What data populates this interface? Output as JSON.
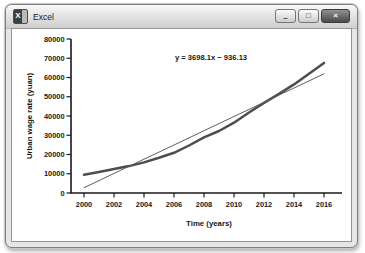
{
  "window": {
    "title": "Excel",
    "icon": "excel-logo-icon",
    "icon_letter": "X",
    "controls": [
      {
        "name": "minimize",
        "glyph": "–"
      },
      {
        "name": "maximize",
        "glyph": "□"
      },
      {
        "name": "close",
        "glyph": "×"
      }
    ]
  },
  "chart_data": {
    "type": "line",
    "title": "",
    "annotation": "y = 3698.1x − 936.13",
    "xlabel": "Time (years)",
    "ylabel": "Urban wage rate (yuan)",
    "xlim": [
      2000,
      2016
    ],
    "ylim": [
      0,
      80000
    ],
    "x_ticks": [
      2000,
      2002,
      2004,
      2006,
      2008,
      2010,
      2012,
      2014,
      2016
    ],
    "y_ticks": [
      0,
      10000,
      20000,
      30000,
      40000,
      50000,
      60000,
      70000,
      80000
    ],
    "grid": false,
    "legend": "none",
    "x": [
      2000,
      2001,
      2002,
      2003,
      2004,
      2005,
      2006,
      2007,
      2008,
      2009,
      2010,
      2011,
      2012,
      2013,
      2014,
      2015,
      2016
    ],
    "series": [
      {
        "name": "urban-wage-rate",
        "color": "#4d4d4d",
        "width": 2.5,
        "values": [
          9500,
          10900,
          12400,
          14000,
          15900,
          18300,
          20900,
          24700,
          28900,
          32200,
          36500,
          41800,
          46800,
          51500,
          56400,
          62000,
          67600
        ]
      },
      {
        "name": "linear-trend",
        "color": "#5e5e5e",
        "width": 1,
        "values": [
          2762,
          6460,
          10158,
          13856,
          17554,
          21252,
          24951,
          28649,
          32347,
          36045,
          39743,
          43441,
          47139,
          50837,
          54535,
          58233,
          61932
        ]
      }
    ]
  }
}
